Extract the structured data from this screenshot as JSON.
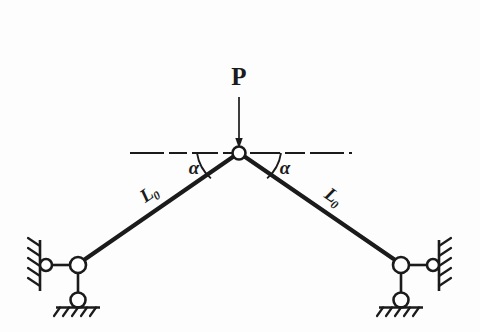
{
  "figure": {
    "background_color": "#fdfdfd",
    "ink_color": "#1b1b1b"
  },
  "labels": {
    "load": "P",
    "angle_left": "α",
    "angle_right": "α",
    "member_left_base": "L",
    "member_left_sub": "0",
    "member_right_base": "L",
    "member_right_sub": "0"
  },
  "geometry": {
    "apex": {
      "x": 239,
      "y": 153,
      "radius": 6.5
    },
    "left_joint": {
      "x": 78,
      "y": 265,
      "radius": 8
    },
    "right_joint": {
      "x": 401,
      "y": 265,
      "radius": 8
    },
    "left_wall_pin": {
      "x": 46,
      "y": 265,
      "radius": 6
    },
    "right_wall_pin": {
      "x": 433,
      "y": 265,
      "radius": 6
    },
    "left_roller": {
      "x": 78,
      "y": 300,
      "radius": 7.5
    },
    "right_roller": {
      "x": 401,
      "y": 300,
      "radius": 7.5
    },
    "axis_line": {
      "x1": 130,
      "x2": 352,
      "y": 153
    },
    "load_arrow": {
      "x": 239,
      "y_top": 97,
      "y_bottom": 146
    },
    "angle_arc_radius": 42
  },
  "annotations": {
    "load_label_position": {
      "x": 239,
      "y": 85
    },
    "alpha_left_position": {
      "x": 194,
      "y": 174
    },
    "alpha_right_position": {
      "x": 285,
      "y": 174
    },
    "member_left_label_position": {
      "x": 150,
      "y": 200
    },
    "member_right_label_position": {
      "x": 328,
      "y": 200
    }
  }
}
